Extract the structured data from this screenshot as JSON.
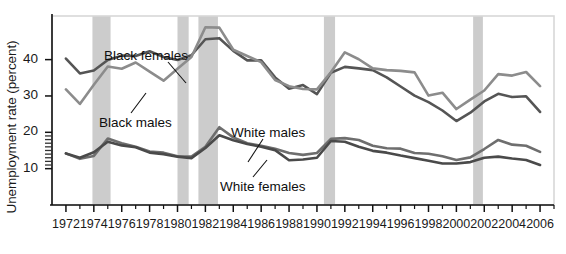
{
  "chart_data": {
    "type": "line",
    "title": "",
    "xlabel": "",
    "ylabel": "Unemployment rate (percent)",
    "xlim": [
      1971,
      2007
    ],
    "ylim": [
      0,
      52
    ],
    "yticks": [
      10,
      20,
      30,
      40
    ],
    "ytick_labels": [
      "10",
      "20",
      "30",
      "40"
    ],
    "minor_yticks": [
      11,
      12,
      13,
      14,
      15,
      16,
      17,
      18,
      19
    ],
    "grid": false,
    "legend_position": "inline-annotations",
    "x": [
      1972,
      1973,
      1974,
      1975,
      1976,
      1977,
      1978,
      1979,
      1980,
      1981,
      1982,
      1983,
      1984,
      1985,
      1986,
      1987,
      1988,
      1989,
      1990,
      1991,
      1992,
      1993,
      1994,
      1995,
      1996,
      1997,
      1998,
      1999,
      2000,
      2001,
      2002,
      2003,
      2004,
      2005,
      2006
    ],
    "series": [
      {
        "name": "Black females",
        "color": "#555555",
        "values": [
          40.3,
          36.2,
          37.0,
          39.9,
          41.1,
          41.0,
          42.3,
          40.7,
          39.9,
          41.2,
          45.6,
          45.9,
          42.4,
          39.8,
          39.8,
          35.1,
          32.0,
          33.0,
          30.5,
          36.4,
          38.0,
          37.6,
          37.1,
          35.1,
          32.6,
          30.1,
          28.3,
          26.0,
          23.1,
          25.4,
          28.5,
          30.6,
          29.7,
          29.9,
          25.6
        ]
      },
      {
        "name": "Black males",
        "color": "#8c8c8c",
        "values": [
          31.8,
          27.8,
          33.1,
          38.1,
          37.5,
          39.2,
          36.7,
          34.2,
          37.5,
          40.7,
          48.9,
          48.8,
          42.7,
          41.0,
          39.3,
          34.4,
          32.7,
          31.9,
          31.8,
          36.5,
          42.0,
          40.1,
          37.6,
          37.1,
          36.9,
          36.5,
          30.1,
          30.9,
          26.4,
          29.0,
          31.5,
          36.0,
          35.6,
          36.6,
          32.7
        ]
      },
      {
        "name": "White males",
        "color": "#6e6e6e",
        "values": [
          14.2,
          12.7,
          13.5,
          18.3,
          17.0,
          16.0,
          14.7,
          14.4,
          13.4,
          13.3,
          16.0,
          21.4,
          18.6,
          17.0,
          16.3,
          15.5,
          14.3,
          13.8,
          14.3,
          18.2,
          18.4,
          17.9,
          16.3,
          15.6,
          15.5,
          14.3,
          14.1,
          13.4,
          12.4,
          13.1,
          15.4,
          17.9,
          16.6,
          16.3,
          14.6
        ]
      },
      {
        "name": "White females",
        "color": "#4a4a4a",
        "values": [
          14.2,
          13.0,
          14.5,
          17.4,
          16.4,
          15.9,
          14.4,
          14.0,
          13.3,
          12.9,
          15.7,
          19.2,
          17.8,
          16.8,
          16.0,
          15.1,
          12.3,
          12.5,
          13.0,
          17.6,
          17.4,
          16.0,
          14.9,
          14.4,
          13.6,
          12.9,
          12.2,
          11.4,
          11.4,
          11.8,
          13.0,
          13.3,
          12.8,
          12.4,
          11.0
        ]
      }
    ],
    "recession_bands": [
      {
        "start": 1973.9,
        "end": 1975.2
      },
      {
        "start": 1980.0,
        "end": 1980.8
      },
      {
        "start": 1981.5,
        "end": 1982.9
      },
      {
        "start": 1990.5,
        "end": 1991.3
      },
      {
        "start": 2001.2,
        "end": 2001.9
      }
    ],
    "recession_band_color": "#cccccc",
    "annotations": [
      {
        "label": "Black females",
        "x": 104,
        "y": 48,
        "leader": [
          [
            168,
            62
          ],
          [
            186,
            83
          ]
        ]
      },
      {
        "label": "Black males",
        "x": 99,
        "y": 115,
        "leader": [
          [
            131,
            113
          ],
          [
            146,
            93
          ]
        ]
      },
      {
        "label": "White males",
        "x": 231,
        "y": 125,
        "leader": [
          [
            263,
            139
          ],
          [
            248,
            162
          ]
        ]
      },
      {
        "label": "White females",
        "x": 220,
        "y": 179,
        "leader": [
          [
            253,
            177
          ],
          [
            267,
            160
          ]
        ]
      }
    ],
    "xtick_labels": [
      "1972",
      "1974",
      "1976",
      "1978",
      "1980",
      "1982",
      "1984",
      "1986",
      "1988",
      "1990",
      "1992",
      "1994",
      "1996",
      "1998",
      "2000",
      "2002",
      "2004",
      "2006"
    ],
    "xtick_values": [
      1972,
      1974,
      1976,
      1978,
      1980,
      1982,
      1984,
      1986,
      1988,
      1990,
      1992,
      1994,
      1996,
      1998,
      2000,
      2002,
      2004,
      2006
    ]
  }
}
